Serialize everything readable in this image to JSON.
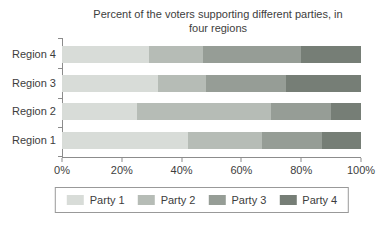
{
  "chart_data": {
    "type": "bar",
    "variant": "horizontal-stacked",
    "title": "Percent of the voters supporting different parties, in four regions",
    "categories": [
      "Region 4",
      "Region 3",
      "Region 2",
      "Region 1"
    ],
    "series": [
      {
        "name": "Party 1",
        "color": "#d8dcd8",
        "values": [
          29,
          32,
          25,
          42
        ]
      },
      {
        "name": "Party 2",
        "color": "#b6bcb6",
        "values": [
          18,
          16,
          45,
          25
        ]
      },
      {
        "name": "Party 3",
        "color": "#969d96",
        "values": [
          33,
          27,
          20,
          20
        ]
      },
      {
        "name": "Party 4",
        "color": "#767e76",
        "values": [
          20,
          25,
          10,
          13
        ]
      }
    ],
    "x_ticks": [
      "0%",
      "20%",
      "40%",
      "60%",
      "80%",
      "100%"
    ],
    "xlim": [
      0,
      100
    ],
    "unit": "percent",
    "grid": false,
    "legend_position": "bottom",
    "axis_color": "#8c8c8c",
    "text_color": "#3d3d3d"
  }
}
